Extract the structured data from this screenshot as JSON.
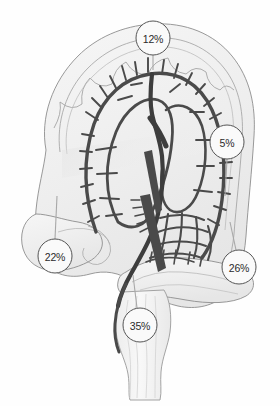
{
  "figure": {
    "background_color": "#fefefe"
  },
  "palette": {
    "organ_fill": "#f2f2f2",
    "organ_fill_light": "#f7f7f7",
    "organ_outline": "#8a8a8a",
    "organ_outline_soft": "#b4b4b4",
    "vessel_color": "#4a4a4a",
    "vessel_color_dark": "#3d3d3d",
    "callout_fill": "#fafafa",
    "callout_stroke": "#555555",
    "callout_text": "#2b2b2b",
    "leader_line": "#a8a8a8",
    "shadow": "#d9d9d9"
  },
  "callouts": [
    {
      "id": "transverse-colon",
      "value": "12%",
      "cx": 153,
      "cy": 38,
      "r": 17,
      "leader": {
        "x1": 153,
        "y1": 55,
        "x2": 153,
        "y2": 70
      }
    },
    {
      "id": "descending-colon",
      "value": "5%",
      "cx": 227,
      "cy": 142,
      "r": 17,
      "leader": {
        "x1": 227,
        "y1": 159,
        "x2": 225,
        "y2": 196
      }
    },
    {
      "id": "ascending-colon",
      "value": "22%",
      "cx": 55,
      "cy": 256,
      "r": 17,
      "leader": {
        "x1": 55,
        "y1": 239,
        "x2": 57,
        "y2": 196
      }
    },
    {
      "id": "sigmoid-colon",
      "value": "26%",
      "cx": 239,
      "cy": 267,
      "r": 17,
      "leader": {
        "x1": 236,
        "y1": 250,
        "x2": 230,
        "y2": 222
      }
    },
    {
      "id": "rectum",
      "value": "35%",
      "cx": 140,
      "cy": 325,
      "r": 17,
      "leader": {
        "x1": 137,
        "y1": 308,
        "x2": 133,
        "y2": 275
      }
    }
  ],
  "chart_data": {
    "type": "pie",
    "categories": [
      "transverse-colon",
      "descending-colon",
      "ascending-colon",
      "sigmoid-colon",
      "rectum"
    ],
    "labels": [
      "12%",
      "5%",
      "22%",
      "26%",
      "35%"
    ],
    "values": [
      12,
      5,
      22,
      26,
      35
    ],
    "xlabel": "",
    "ylabel": "",
    "legend": "none",
    "grid": false,
    "annotations": [
      "12%",
      "5%",
      "22%",
      "26%",
      "35%"
    ]
  }
}
